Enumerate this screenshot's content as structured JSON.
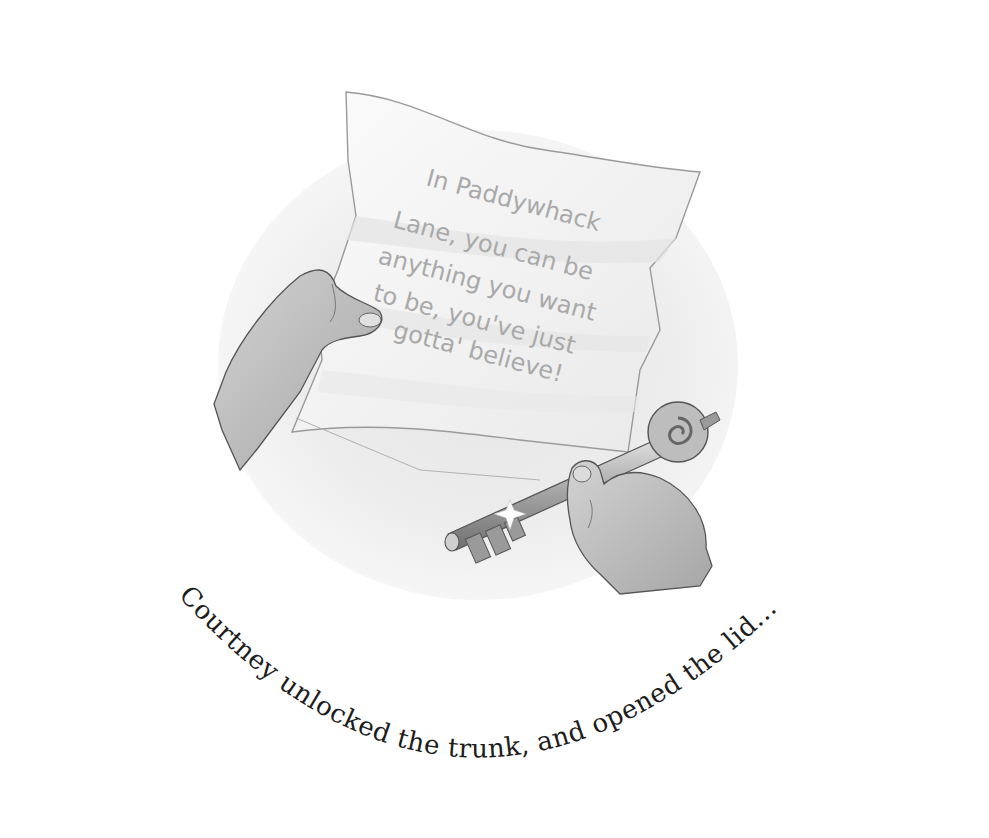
{
  "illustration": {
    "subject": "Hand holding a handwritten letter and a hand holding an ornate key",
    "palette": {
      "background": "#ffffff",
      "vignette": "#e6e6e6",
      "paper": "#f7f7f7",
      "paper_outline": "#9a9a9a",
      "letter_ink": "#a9a9a9",
      "skin": "#bdbdbd",
      "key_metal": "#8f8f8f",
      "caption_ink": "#1c1c1c"
    },
    "icons": [
      "letter-icon",
      "hand-icon",
      "key-icon",
      "sparkle-icon"
    ]
  },
  "letter": {
    "lines": [
      "In Paddywhack",
      "Lane, you can be",
      "anything  you want",
      "to be, you've just",
      "gotta' believe!"
    ]
  },
  "caption": {
    "text": "Courtney unlocked the trunk, and opened the lid..."
  }
}
